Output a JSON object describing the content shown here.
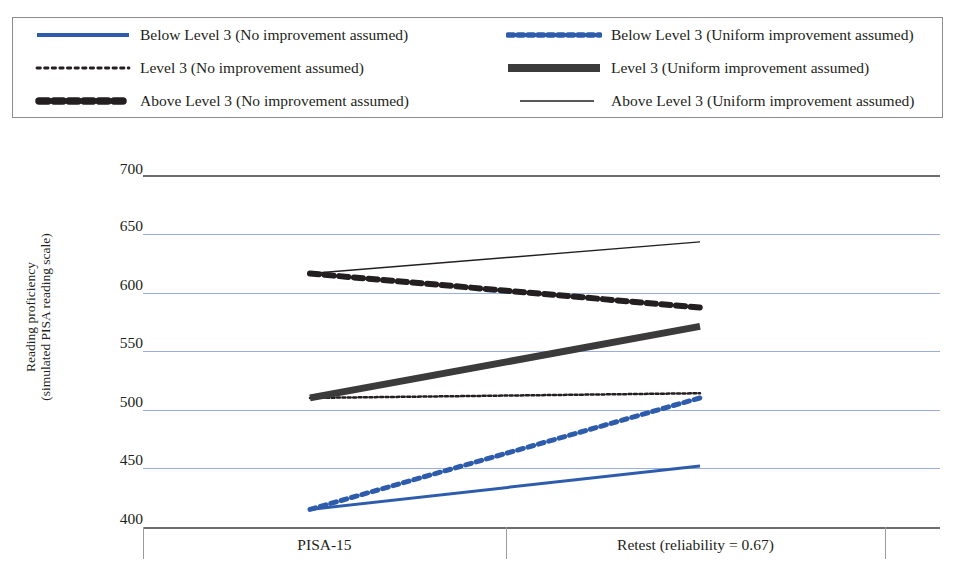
{
  "title": "",
  "legend": {
    "items": [
      {
        "label": "Below Level 3 (No improvement assumed)",
        "style": "solid-thick",
        "color": "#2E5CAD"
      },
      {
        "label": "Below Level 3 (Uniform improvement assumed)",
        "style": "dotted-thick",
        "color": "#2E5CAD"
      },
      {
        "label": "Level 3 (No improvement assumed)",
        "style": "dotted-thin",
        "color": "#231f20"
      },
      {
        "label": "Level 3 (Uniform improvement assumed)",
        "style": "solid-extrathick",
        "color": "#3b3b3b"
      },
      {
        "label": "Above Level 3 (No improvement assumed)",
        "style": "dashed-extrathick",
        "color": "#231f20"
      },
      {
        "label": "Above Level 3 (Uniform improvement assumed)",
        "style": "solid-thin",
        "color": "#231f20"
      }
    ]
  },
  "axes": {
    "ylabel_line1": "Reading proficiency",
    "ylabel_line2": "(simulated PISA reading scale)",
    "yticks": [
      "700",
      "650",
      "600",
      "550",
      "500",
      "450",
      "400"
    ],
    "xcategories": [
      "PISA-15",
      "Retest (reliability = 0.67)"
    ]
  },
  "chart_data": {
    "type": "line",
    "title": "",
    "xlabel": "",
    "ylabel": "Reading proficiency (simulated PISA reading scale)",
    "x": [
      "PISA-15",
      "Retest (reliability = 0.67)"
    ],
    "ylim": [
      400,
      700
    ],
    "yticks": [
      400,
      450,
      500,
      550,
      600,
      650,
      700
    ],
    "grid": true,
    "legend_position": "top",
    "series": [
      {
        "name": "Below Level 3 (No improvement assumed)",
        "values": [
          415,
          452
        ],
        "color": "#2E5CAD",
        "style": "solid",
        "width": 3
      },
      {
        "name": "Below Level 3 (Uniform improvement assumed)",
        "values": [
          415,
          510
        ],
        "color": "#2E5CAD",
        "style": "dotted",
        "width": 5
      },
      {
        "name": "Level 3 (No improvement assumed)",
        "values": [
          510,
          514
        ],
        "color": "#231f20",
        "style": "dotted",
        "width": 2.5
      },
      {
        "name": "Level 3 (Uniform improvement assumed)",
        "values": [
          510,
          571
        ],
        "color": "#3b3b3b",
        "style": "solid",
        "width": 7
      },
      {
        "name": "Above Level 3 (No improvement assumed)",
        "values": [
          616,
          587
        ],
        "color": "#231f20",
        "style": "dashed",
        "width": 6
      },
      {
        "name": "Above Level 3 (Uniform improvement assumed)",
        "values": [
          616,
          643
        ],
        "color": "#231f20",
        "style": "solid",
        "width": 1.4
      }
    ]
  }
}
